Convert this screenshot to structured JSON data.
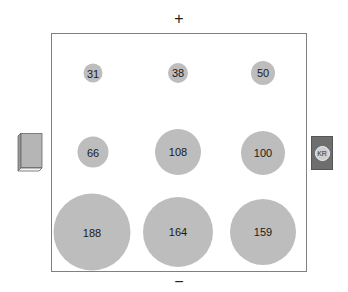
{
  "axis": {
    "top_label": "+",
    "bottom_label": "−"
  },
  "left_icon": {
    "name": "book-icon"
  },
  "right_icon": {
    "name": "panel-icon",
    "badge_text": "KR"
  },
  "grid": {
    "rows": [
      [
        {
          "value": "31"
        },
        {
          "value": "38"
        },
        {
          "value": "50"
        }
      ],
      [
        {
          "value": "66"
        },
        {
          "value": "108"
        },
        {
          "value": "100"
        }
      ],
      [
        {
          "value": "188"
        },
        {
          "value": "164"
        },
        {
          "value": "159"
        }
      ]
    ]
  },
  "colors": {
    "bubble": "#bdbdbd",
    "frame": "#808080",
    "panel": "#6e6e6e"
  }
}
